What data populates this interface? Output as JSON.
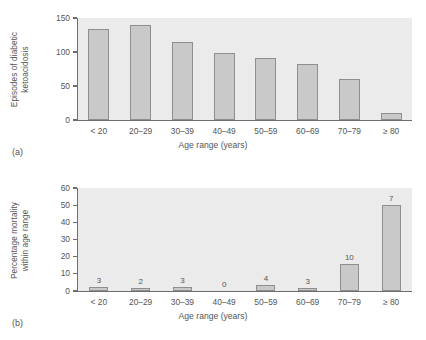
{
  "figure": {
    "panels": [
      {
        "letter": "(a)",
        "ylabel_line1": "Episodes of diabetic",
        "ylabel_line2": "ketoacidosis",
        "xtitle": "Age range (years)"
      },
      {
        "letter": "(b)",
        "ylabel_line1": "Percentage mortality",
        "ylabel_line2": "within age range",
        "xtitle": "Age range (years)"
      }
    ]
  },
  "colors": {
    "bar_fill": "#c9c9c9",
    "bar_stroke": "#8e8e8e",
    "plot_background": "#ebebeb",
    "axis": "#6d6d6d",
    "text": "#555555"
  },
  "chart_data": [
    {
      "type": "bar",
      "title": "",
      "xlabel": "Age range (years)",
      "ylabel": "Episodes of diabetic ketoacidosis",
      "categories": [
        "< 20",
        "20–29",
        "30–39",
        "40–49",
        "50–59",
        "60–69",
        "70–79",
        "≥ 80"
      ],
      "values": [
        134,
        139,
        114,
        98,
        91,
        83,
        61,
        10
      ],
      "ylim": [
        0,
        150
      ],
      "yticks": [
        0,
        50,
        100,
        150
      ],
      "ytick_labels": [
        "0",
        "50",
        "100",
        "150"
      ],
      "grid": false,
      "legend": false,
      "panel": "(a)"
    },
    {
      "type": "bar",
      "title": "",
      "xlabel": "Age range (years)",
      "ylabel": "Percentage mortality within age range",
      "categories": [
        "< 20",
        "20–29",
        "30–39",
        "40–49",
        "50–59",
        "60–69",
        "70–79",
        "≥ 80"
      ],
      "values": [
        2.5,
        1.5,
        2.5,
        0,
        3.5,
        1.5,
        16,
        50
      ],
      "bar_annotations": [
        "3",
        "2",
        "3",
        "0",
        "4",
        "3",
        "10",
        "7"
      ],
      "ylim": [
        0,
        60
      ],
      "yticks": [
        0,
        10,
        20,
        30,
        40,
        50,
        60
      ],
      "ytick_labels": [
        "0",
        "10",
        "20",
        "30",
        "40",
        "50",
        "60"
      ],
      "grid": false,
      "legend": false,
      "panel": "(b)"
    }
  ]
}
